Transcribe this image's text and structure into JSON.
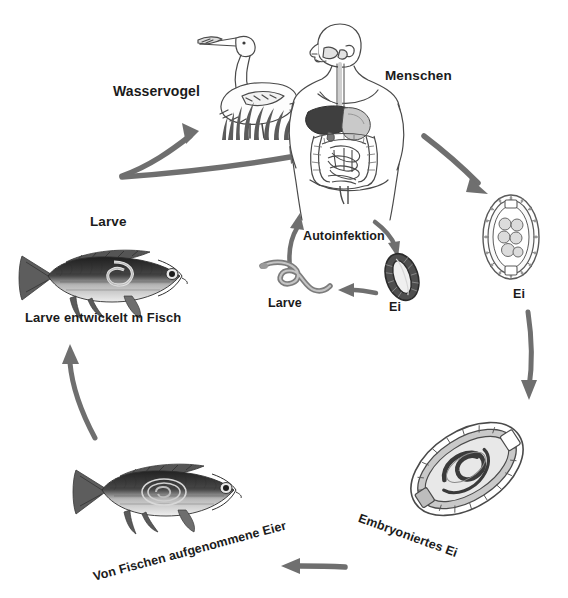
{
  "diagram": {
    "background_color": "#ffffff",
    "arrow_color": "#6f6f6f",
    "text_color": "#1b1b1b",
    "labels": {
      "wasservogel": "Wasservogel",
      "menschen": "Menschen",
      "larve_fisch_top": "Larve",
      "larve_entwickelt": "Larve entwickelt m Fisch",
      "autoinfektion": "Autoinfektion",
      "larve_center": "Larve",
      "ei_center": "Ei",
      "ei_right": "Ei",
      "embryoniertes_ei": "Embryoniertes Ei",
      "von_fischen": "Von Fischen aufgenommene Eier"
    },
    "nodes": [
      {
        "id": "wasservogel",
        "label": "Wasservogel",
        "art": "heron-with-grass"
      },
      {
        "id": "menschen",
        "label": "Menschen",
        "art": "human-digestive-system"
      },
      {
        "id": "ei-right",
        "label": "Ei",
        "art": "egg-unembryonated"
      },
      {
        "id": "embryoniertes-ei",
        "label": "Embryoniertes Ei",
        "art": "egg-embryonated"
      },
      {
        "id": "fisch-unten",
        "label": "Von Fischen aufgenommene Eier",
        "art": "carp-fish"
      },
      {
        "id": "fisch-larve",
        "label": "Larve entwickelt m Fisch",
        "art": "carp-fish-larva"
      },
      {
        "id": "larve-zentrum",
        "label": "Larve",
        "art": "larva-worm"
      },
      {
        "id": "ei-zentrum",
        "label": "Ei",
        "art": "egg-proglottid"
      }
    ],
    "arrows": [
      {
        "id": "fisch-zu-vogel",
        "from": "fisch-larve",
        "to": "wasservogel"
      },
      {
        "id": "fisch-zu-mensch",
        "from": "fisch-larve",
        "to": "menschen"
      },
      {
        "id": "mensch-zu-ei",
        "from": "menschen",
        "to": "ei-right"
      },
      {
        "id": "ei-zu-embryo",
        "from": "ei-right",
        "to": "embryoniertes-ei"
      },
      {
        "id": "embryo-zu-fisch",
        "from": "embryoniertes-ei",
        "to": "fisch-unten"
      },
      {
        "id": "fisch-zu-larvenfisch",
        "from": "fisch-unten",
        "to": "fisch-larve"
      },
      {
        "id": "mensch-zu-ei-zentrum",
        "from": "menschen",
        "to": "ei-zentrum"
      },
      {
        "id": "ei-zu-larve-zentrum",
        "from": "ei-zentrum",
        "to": "larve-zentrum"
      },
      {
        "id": "larve-zu-mensch",
        "from": "larve-zentrum",
        "to": "menschen"
      }
    ]
  }
}
